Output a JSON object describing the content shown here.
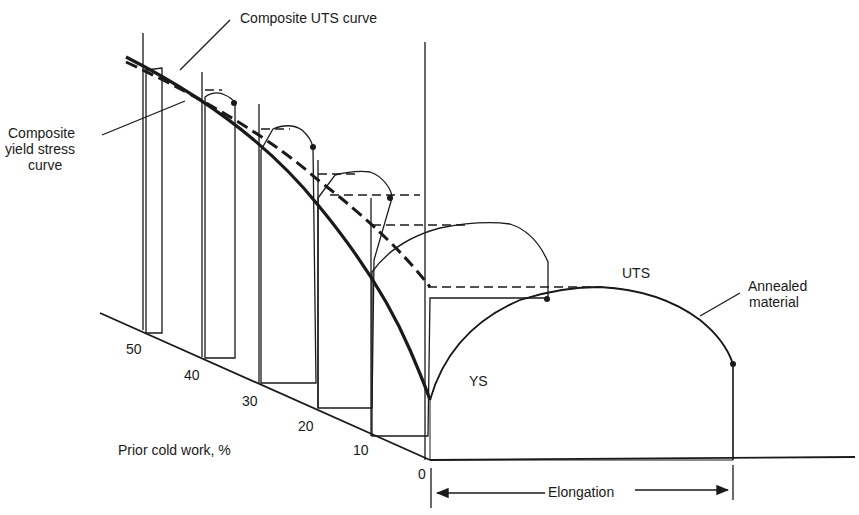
{
  "figure": {
    "labels": {
      "composite_uts": "Composite UTS curve",
      "composite_ys_line1": "Composite",
      "composite_ys_line2": "yield stress",
      "composite_ys_line3": "curve",
      "uts": "UTS",
      "ys": "YS",
      "annealed_line1": "Annealed",
      "annealed_line2": "material",
      "cold_work_axis": "Prior cold work, %",
      "elongation_axis": "Elongation",
      "origin": "0"
    },
    "cold_work_ticks": [
      "50",
      "40",
      "30",
      "20",
      "10"
    ],
    "colors": {
      "ink": "#1a1a1a",
      "background": "#ffffff"
    }
  }
}
